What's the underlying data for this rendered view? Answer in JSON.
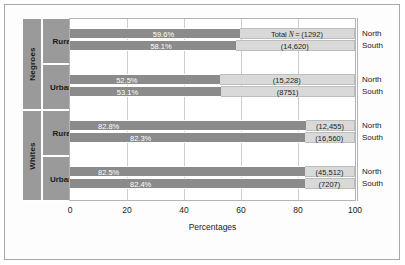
{
  "chart_data": {
    "type": "bar",
    "title": "",
    "xlabel": "Percentages",
    "ylabel": "",
    "xlim": [
      0,
      100
    ],
    "xticks": [
      0,
      20,
      40,
      60,
      80,
      100
    ],
    "grid": true,
    "orientation": "horizontal",
    "stacked": true,
    "legend": "none",
    "groups": [
      {
        "race": "Negroes",
        "locations": [
          {
            "location": "Rural",
            "rows": [
              {
                "region": "North",
                "percent": 59.6,
                "percent_label": "59.6%",
                "n_label": "Total N = (1292)",
                "n_value": 1292
              },
              {
                "region": "South",
                "percent": 58.1,
                "percent_label": "58.1%",
                "n_label": "(14,620)",
                "n_value": 14620
              }
            ]
          },
          {
            "location": "Urban",
            "rows": [
              {
                "region": "North",
                "percent": 52.5,
                "percent_label": "52.5%",
                "n_label": "(15,228)",
                "n_value": 15228
              },
              {
                "region": "South",
                "percent": 53.1,
                "percent_label": "53.1%",
                "n_label": "(8751)",
                "n_value": 8751
              }
            ]
          }
        ]
      },
      {
        "race": "Whites",
        "locations": [
          {
            "location": "Rural",
            "rows": [
              {
                "region": "North",
                "percent": 82.8,
                "percent_label": "82.8%",
                "n_label": "(12,455)",
                "n_value": 12455
              },
              {
                "region": "South",
                "percent": 82.3,
                "percent_label": "82.3%",
                "n_label": "(16,560)",
                "n_value": 16560
              }
            ]
          },
          {
            "location": "Urban",
            "rows": [
              {
                "region": "North",
                "percent": 82.5,
                "percent_label": "82.5%",
                "n_label": "(45,512)",
                "n_value": 45512
              },
              {
                "region": "South",
                "percent": 82.4,
                "percent_label": "82.4%",
                "n_label": "(7207)",
                "n_value": 7207
              }
            ]
          }
        ]
      }
    ],
    "colors": {
      "bar_dark": "#8b8b8b",
      "bar_light": "#d9d9d9",
      "panel": "#9a9a9a",
      "grid": "#cdcdcd",
      "frame": "#a8a8a8",
      "text": "#1b1b1b",
      "bar_text": "#ffffff"
    }
  },
  "axis": {
    "title": "Percentages",
    "ticks": [
      "0",
      "20",
      "40",
      "60",
      "80",
      "100"
    ]
  },
  "panels": {
    "race": [
      "Negroes",
      "Whites"
    ],
    "location": [
      "Rural",
      "Urban",
      "Rural",
      "Urban"
    ]
  },
  "regions": [
    "North",
    "South",
    "North",
    "South",
    "North",
    "South",
    "North",
    "South"
  ]
}
